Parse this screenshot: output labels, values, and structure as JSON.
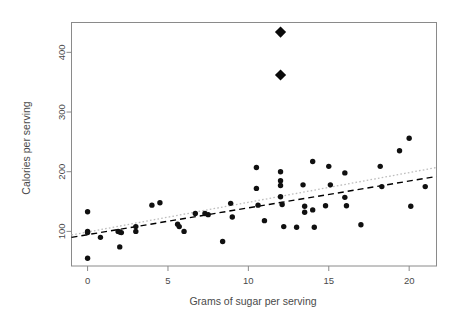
{
  "chart_data": {
    "type": "scatter",
    "title": "",
    "xlabel": "Grams of sugar per serving",
    "ylabel": "Calories per serving",
    "xlim": [
      -1.0,
      21.7
    ],
    "ylim": [
      42,
      450
    ],
    "xticks": [
      0,
      5,
      10,
      15,
      20
    ],
    "xtick_labels": [
      "0",
      "5",
      "10",
      "15",
      "20"
    ],
    "yticks": [
      100,
      200,
      300,
      400
    ],
    "ytick_labels": [
      "100",
      "200",
      "300",
      "400"
    ],
    "grid": false,
    "legend": "none",
    "series": [
      {
        "name": "cereals",
        "marker": "filled-circle",
        "color": "#101010",
        "points": [
          [
            0.0,
            133
          ],
          [
            0.0,
            100
          ],
          [
            0.0,
            98
          ],
          [
            0.0,
            55
          ],
          [
            0.8,
            90
          ],
          [
            1.9,
            100
          ],
          [
            2.0,
            99
          ],
          [
            2.1,
            98
          ],
          [
            2.0,
            74
          ],
          [
            3.0,
            108
          ],
          [
            3.0,
            100
          ],
          [
            4.0,
            144
          ],
          [
            4.5,
            148
          ],
          [
            5.6,
            112
          ],
          [
            5.7,
            108
          ],
          [
            6.0,
            100
          ],
          [
            6.7,
            130
          ],
          [
            7.3,
            130
          ],
          [
            7.5,
            128
          ],
          [
            8.4,
            83
          ],
          [
            8.9,
            147
          ],
          [
            9.0,
            124
          ],
          [
            10.5,
            207
          ],
          [
            10.5,
            172
          ],
          [
            10.6,
            144
          ],
          [
            11.0,
            118
          ],
          [
            12.0,
            200
          ],
          [
            12.0,
            185
          ],
          [
            12.0,
            177
          ],
          [
            12.0,
            158
          ],
          [
            12.1,
            145
          ],
          [
            12.2,
            108
          ],
          [
            13.0,
            107
          ],
          [
            13.4,
            178
          ],
          [
            13.5,
            142
          ],
          [
            13.5,
            132
          ],
          [
            14.0,
            217
          ],
          [
            14.0,
            136
          ],
          [
            14.1,
            107
          ],
          [
            14.8,
            143
          ],
          [
            15.0,
            209
          ],
          [
            15.1,
            178
          ],
          [
            16.0,
            198
          ],
          [
            16.0,
            157
          ],
          [
            16.1,
            143
          ],
          [
            17.0,
            111
          ],
          [
            18.2,
            209
          ],
          [
            18.3,
            175
          ],
          [
            19.4,
            235
          ],
          [
            20.0,
            256
          ],
          [
            20.1,
            142
          ],
          [
            21.0,
            175
          ]
        ]
      },
      {
        "name": "outliers",
        "marker": "filled-diamond",
        "color": "#0a0a0a",
        "points": [
          [
            12.0,
            434
          ],
          [
            12.0,
            362
          ]
        ]
      }
    ],
    "lines": [
      {
        "name": "robust-fit",
        "style": "dashed",
        "color": "#000000",
        "x": [
          -1.0,
          21.7
        ],
        "y": [
          90,
          192
        ]
      },
      {
        "name": "ols-fit",
        "style": "dotted",
        "color": "#bdbdbd",
        "x": [
          -1.0,
          21.7
        ],
        "y": [
          94,
          207
        ]
      }
    ]
  },
  "axes": {
    "x_label": "Grams of sugar per serving",
    "y_label": "Calories per serving"
  }
}
